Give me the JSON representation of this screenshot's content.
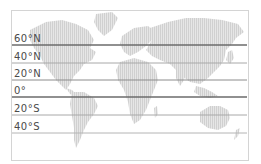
{
  "diagram": {
    "type": "world-map-latitude-lines",
    "colors": {
      "land": "#d9d9d9",
      "major_line": "#6b6b6b",
      "minor_line": "#a8a8a8",
      "frame": "#d4d4d4",
      "label": "#4a4a4a"
    },
    "latitudes": [
      {
        "label": "60°N",
        "y": 45,
        "major": true
      },
      {
        "label": "40°N",
        "y": 63,
        "major": false
      },
      {
        "label": "20°N",
        "y": 80,
        "major": false
      },
      {
        "label": "0°",
        "y": 97,
        "major": true
      },
      {
        "label": "20°S",
        "y": 115,
        "major": false
      },
      {
        "label": "40°S",
        "y": 133,
        "major": false
      }
    ]
  }
}
